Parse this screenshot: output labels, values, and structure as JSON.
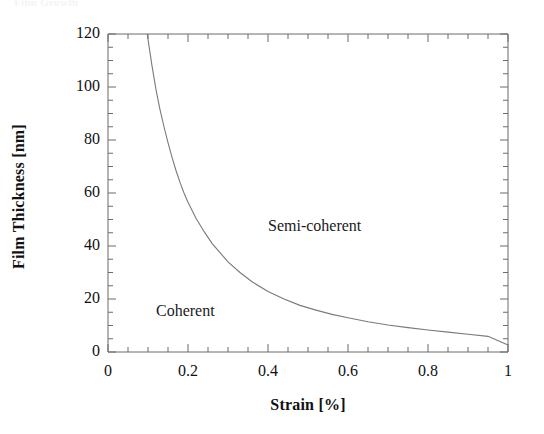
{
  "figure": {
    "cropped_header_text": "Film Growth",
    "background_color": "#ffffff",
    "frame_color": "#6b6b6b",
    "curve_color": "#7a7a7a"
  },
  "chart_data": {
    "type": "line",
    "title": "",
    "subtitle": "",
    "xlabel": "Strain [%]",
    "ylabel": "Film Thickness [nm]",
    "xlim": [
      0,
      1
    ],
    "ylim": [
      0,
      120
    ],
    "grid": false,
    "legend": null,
    "x_ticks": [
      0,
      0.2,
      0.4,
      0.6,
      0.8,
      1
    ],
    "x_tick_labels": [
      "0",
      "0.2",
      "0.4",
      "0.6",
      "0.8",
      "1"
    ],
    "x_minor_tick_step": 0.05,
    "y_ticks": [
      0,
      20,
      40,
      60,
      80,
      100,
      120
    ],
    "y_tick_labels": [
      "0",
      "20",
      "40",
      "60",
      "80",
      "100",
      "120"
    ],
    "y_minor_tick_step": 5,
    "series": [
      {
        "name": "Critical thickness",
        "description": "Boundary between coherent and semi-coherent film growth",
        "x": [
          0.098,
          0.105,
          0.11,
          0.12,
          0.13,
          0.14,
          0.15,
          0.16,
          0.17,
          0.18,
          0.19,
          0.2,
          0.22,
          0.24,
          0.26,
          0.28,
          0.3,
          0.33,
          0.36,
          0.4,
          0.44,
          0.48,
          0.52,
          0.56,
          0.6,
          0.65,
          0.7,
          0.75,
          0.8,
          0.85,
          0.9,
          0.95,
          1.0
        ],
        "y": [
          120.0,
          113.0,
          108.0,
          99.0,
          91.5,
          85.0,
          79.0,
          73.5,
          68.5,
          64.0,
          60.0,
          56.5,
          50.5,
          45.5,
          41.0,
          37.5,
          34.0,
          30.0,
          26.5,
          22.8,
          20.0,
          17.6,
          15.8,
          14.2,
          12.9,
          11.4,
          10.2,
          9.2,
          8.3,
          7.5,
          6.7,
          5.9,
          2.6
        ]
      }
    ],
    "annotations": [
      {
        "text": "Coherent",
        "x": 0.12,
        "y": 15
      },
      {
        "text": "Semi-coherent",
        "x": 0.4,
        "y": 47
      }
    ]
  }
}
